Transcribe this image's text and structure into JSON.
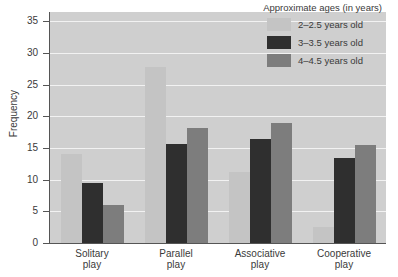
{
  "chart_data": {
    "type": "bar",
    "title": "",
    "xlabel": "",
    "ylabel": "Frequency",
    "categories": [
      "Solitary\nplay",
      "Parallel\nplay",
      "Associative\nplay",
      "Cooperative\nplay"
    ],
    "series": [
      {
        "name": "2–2.5 years old",
        "color": "#c4c4c4",
        "values": [
          14,
          27.8,
          11.2,
          2.5
        ]
      },
      {
        "name": "3–3.5 years old",
        "color": "#2f2f2f",
        "values": [
          9.5,
          15.7,
          16.4,
          13.4
        ]
      },
      {
        "name": "4–4.5 years old",
        "color": "#7d7d7d",
        "values": [
          6,
          18.1,
          18.9,
          15.5
        ]
      }
    ],
    "ylim": [
      0,
      36.5
    ],
    "yticks": [
      0,
      5,
      10,
      15,
      20,
      25,
      30,
      35
    ],
    "ytick_labels": [
      "0",
      "5",
      "10",
      "15",
      "20",
      "25",
      "30",
      "35"
    ],
    "grid": true,
    "gridlines_at": [
      5,
      10,
      15,
      20,
      25,
      30,
      35
    ],
    "legend": {
      "title": "Approximate ages (in years)",
      "position": "top-right"
    },
    "plot_background": "#cfcfcf",
    "gridline_color": "#f2f2f2",
    "axis_color": "#555555",
    "figure_background": "#ffffff"
  }
}
